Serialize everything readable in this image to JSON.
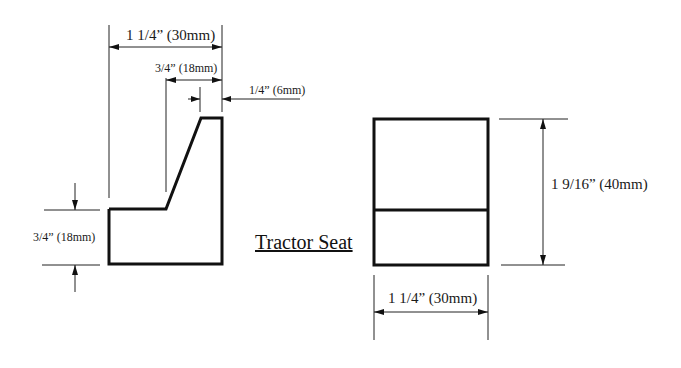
{
  "drawing": {
    "title": "Tractor Seat",
    "side_view": {
      "overall_width_label": "1 1/4” (30mm)",
      "slope_width_label": "3/4” (18mm)",
      "top_width_label": "1/4” (6mm)",
      "step_height_label": "3/4” (18mm)"
    },
    "front_view": {
      "height_label": "1 9/16” (40mm)",
      "width_label": "1 1/4” (30mm)"
    }
  },
  "colors": {
    "line": "#111111",
    "background": "#ffffff"
  }
}
